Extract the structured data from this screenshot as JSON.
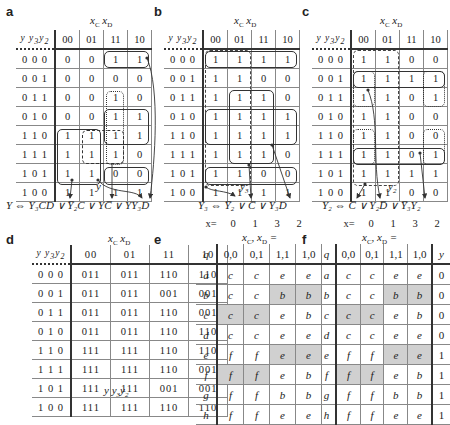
{
  "panels": {
    "a": {
      "letter": "a",
      "col_var": "x_C x_D",
      "row_var": "y y3y2",
      "cols": [
        "00",
        "01",
        "11",
        "10"
      ],
      "rows": [
        {
          "label": "0 0 0",
          "cells": [
            "0",
            "0",
            "1",
            "1"
          ]
        },
        {
          "label": "0 0 1",
          "cells": [
            "0",
            "0",
            "0",
            "0"
          ]
        },
        {
          "label": "0 1 1",
          "cells": [
            "0",
            "0",
            "1",
            "0"
          ]
        },
        {
          "label": "0 1 0",
          "cells": [
            "0",
            "0",
            "1",
            "1"
          ]
        },
        {
          "label": "1 1 0",
          "cells": [
            "1",
            "1",
            "1",
            "1"
          ]
        },
        {
          "label": "1 1 1",
          "cells": [
            "1",
            "1",
            "1",
            "0"
          ]
        },
        {
          "label": "1 0 1",
          "cells": [
            "1",
            "1",
            "0",
            "0"
          ]
        },
        {
          "label": "1 0 0",
          "cells": [
            "1",
            "1",
            "1",
            "1"
          ]
        }
      ],
      "output_label": "y",
      "equation": "Y ⇔ Y₃CD ∨ Y̅₂C ∨ YC̅ ∨ YY₃D"
    },
    "b": {
      "letter": "b",
      "col_var": "x_C x_D",
      "row_var": "y y3y2",
      "cols": [
        "00",
        "01",
        "11",
        "10"
      ],
      "rows": [
        {
          "label": "0 0 0",
          "cells": [
            "1",
            "1",
            "1",
            "1"
          ]
        },
        {
          "label": "0 0 1",
          "cells": [
            "1",
            "1",
            "0",
            "0"
          ]
        },
        {
          "label": "0 1 1",
          "cells": [
            "1",
            "1",
            "1",
            "0"
          ]
        },
        {
          "label": "0 1 0",
          "cells": [
            "1",
            "1",
            "1",
            "1"
          ]
        },
        {
          "label": "1 1 0",
          "cells": [
            "1",
            "1",
            "1",
            "1"
          ]
        },
        {
          "label": "1 1 1",
          "cells": [
            "1",
            "1",
            "1",
            "0"
          ]
        },
        {
          "label": "1 0 1",
          "cells": [
            "1",
            "1",
            "0",
            "0"
          ]
        },
        {
          "label": "1 0 0",
          "cells": [
            "1",
            "1",
            "1",
            "1"
          ]
        }
      ],
      "output_label": "y3",
      "equation": "Y₃ ⇔ Y̅₂ ∨ C̅ ∨ Y₃D"
    },
    "c": {
      "letter": "c",
      "col_var": "x_C x_D",
      "row_var": "y y3y2",
      "cols": [
        "00",
        "01",
        "11",
        "10"
      ],
      "rows": [
        {
          "label": "0 0 0",
          "cells": [
            "1",
            "1",
            "0",
            "0"
          ]
        },
        {
          "label": "0 0 1",
          "cells": [
            "1",
            "1",
            "1",
            "1"
          ]
        },
        {
          "label": "0 1 1",
          "cells": [
            "1",
            "1",
            "0",
            "1"
          ]
        },
        {
          "label": "0 1 0",
          "cells": [
            "1",
            "1",
            "0",
            "0"
          ]
        },
        {
          "label": "1 1 0",
          "cells": [
            "1",
            "1",
            "0",
            "0"
          ]
        },
        {
          "label": "1 1 1",
          "cells": [
            "1",
            "1",
            "0",
            "1"
          ]
        },
        {
          "label": "1 0 1",
          "cells": [
            "1",
            "1",
            "1",
            "1"
          ]
        },
        {
          "label": "1 0 0",
          "cells": [
            "1",
            "1",
            "0",
            "0"
          ]
        }
      ],
      "output_label": "y2",
      "equation": "Y₂ ⇔ C̅ ∨ Y₂D̅ ∨ Y̅₃Y₂"
    },
    "d": {
      "letter": "d",
      "col_var": "x_C x_D",
      "row_var": "y y3y2",
      "cols": [
        "00",
        "01",
        "11",
        "10"
      ],
      "rows": [
        {
          "label": "0 0 0",
          "cells": [
            "011",
            "011",
            "110",
            "110"
          ]
        },
        {
          "label": "0 0 1",
          "cells": [
            "011",
            "011",
            "001",
            "001"
          ]
        },
        {
          "label": "0 1 1",
          "cells": [
            "011",
            "011",
            "110",
            "001"
          ]
        },
        {
          "label": "0 1 0",
          "cells": [
            "011",
            "011",
            "110",
            "110"
          ]
        },
        {
          "label": "1 1 0",
          "cells": [
            "111",
            "111",
            "110",
            "110"
          ]
        },
        {
          "label": "1 1 1",
          "cells": [
            "111",
            "111",
            "110",
            "001"
          ]
        },
        {
          "label": "1 0 1",
          "cells": [
            "111",
            "111",
            "001",
            "001"
          ]
        },
        {
          "label": "1 0 0",
          "cells": [
            "111",
            "111",
            "110",
            "110"
          ]
        }
      ],
      "bottom_label": "y y3y2"
    },
    "e": {
      "letter": "e",
      "x_row": [
        "x=",
        "0",
        "1",
        "3",
        "2"
      ],
      "col_var": "x_C, x_D =",
      "q_header": "q",
      "cols": [
        "0,0",
        "0,1",
        "1,1",
        "1,0"
      ],
      "rows": [
        {
          "label": "a",
          "cells": [
            "c",
            "c",
            "e",
            "e"
          ],
          "shade": [
            false,
            false,
            false,
            false
          ]
        },
        {
          "label": "b",
          "cells": [
            "c",
            "c",
            "b",
            "b"
          ],
          "shade": [
            false,
            false,
            true,
            true
          ]
        },
        {
          "label": "c",
          "cells": [
            "c",
            "c",
            "e",
            "b"
          ],
          "shade": [
            true,
            true,
            false,
            false
          ]
        },
        {
          "label": "d",
          "cells": [
            "c",
            "c",
            "e",
            "e"
          ],
          "shade": [
            false,
            false,
            false,
            false
          ]
        },
        {
          "label": "e",
          "cells": [
            "f",
            "f",
            "e",
            "e"
          ],
          "shade": [
            false,
            false,
            true,
            true
          ]
        },
        {
          "label": "f",
          "cells": [
            "f",
            "f",
            "e",
            "b"
          ],
          "shade": [
            true,
            true,
            false,
            false
          ]
        },
        {
          "label": "g",
          "cells": [
            "f",
            "f",
            "b",
            "b"
          ],
          "shade": [
            false,
            false,
            false,
            false
          ]
        },
        {
          "label": "h",
          "cells": [
            "f",
            "f",
            "e",
            "e"
          ],
          "shade": [
            false,
            false,
            false,
            false
          ]
        }
      ]
    },
    "f": {
      "letter": "f",
      "x_row": [
        "x=",
        "0",
        "1",
        "3",
        "2"
      ],
      "col_var": "x_C, x_D =",
      "q_header": "q",
      "y_header": "y",
      "cols": [
        "0,0",
        "0,1",
        "1,1",
        "1,0"
      ],
      "rows": [
        {
          "label": "a",
          "cells": [
            "c",
            "c",
            "e",
            "e"
          ],
          "y": "0"
        },
        {
          "label": "b",
          "cells": [
            "c",
            "c",
            "b",
            "b"
          ],
          "y": "0"
        },
        {
          "label": "c",
          "cells": [
            "c",
            "c",
            "e",
            "b"
          ],
          "y": "0"
        },
        {
          "label": "d",
          "cells": [
            "c",
            "c",
            "e",
            "e"
          ],
          "y": "0"
        },
        {
          "label": "e",
          "cells": [
            "f",
            "f",
            "e",
            "e"
          ],
          "y": "1"
        },
        {
          "label": "f",
          "cells": [
            "f",
            "f",
            "e",
            "b"
          ],
          "y": "1"
        },
        {
          "label": "g",
          "cells": [
            "f",
            "f",
            "b",
            "b"
          ],
          "y": "1"
        },
        {
          "label": "h",
          "cells": [
            "f",
            "f",
            "e",
            "e"
          ],
          "y": "1"
        }
      ]
    }
  },
  "colors": {
    "line": "#333333",
    "grid": "#888888",
    "shade": "#d0d0d0"
  }
}
